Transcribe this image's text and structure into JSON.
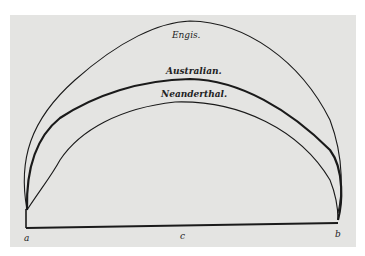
{
  "figure": {
    "curves": [
      {
        "label": "Engis.",
        "weight": "thin"
      },
      {
        "label": "Australian.",
        "weight": "thick"
      },
      {
        "label": "Neanderthal.",
        "weight": "thin"
      }
    ],
    "points": {
      "left": "a",
      "center": "c",
      "right": "b"
    },
    "colors": {
      "background": "#e4e4e2",
      "ink": "#1a1a1a"
    }
  }
}
